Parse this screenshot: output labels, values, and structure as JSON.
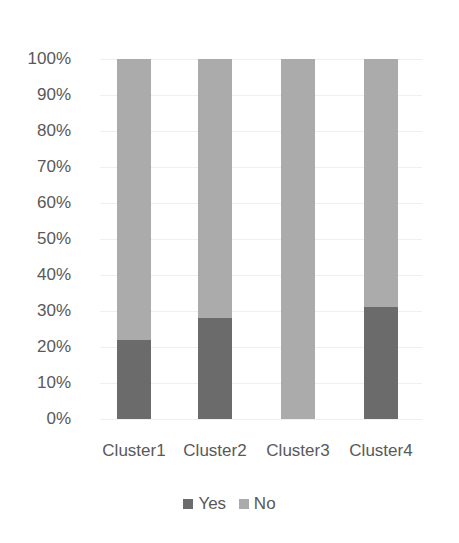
{
  "chart_data": {
    "type": "bar",
    "stacked": "percent",
    "title": "",
    "xlabel": "",
    "ylabel": "",
    "categories": [
      "Cluster1",
      "Cluster2",
      "Cluster3",
      "Cluster4"
    ],
    "series": [
      {
        "name": "Yes",
        "color": "#6b6b6b",
        "values": [
          22,
          28,
          0,
          31
        ]
      },
      {
        "name": "No",
        "color": "#ababab",
        "values": [
          78,
          72,
          100,
          69
        ]
      }
    ],
    "yticks": [
      "0%",
      "10%",
      "20%",
      "30%",
      "40%",
      "50%",
      "60%",
      "70%",
      "80%",
      "90%",
      "100%"
    ],
    "ylim": [
      0,
      100
    ],
    "grid": true,
    "legend_position": "bottom"
  },
  "legend": [
    {
      "label": "Yes",
      "color": "#6b6b6b"
    },
    {
      "label": "No",
      "color": "#ababab"
    }
  ]
}
